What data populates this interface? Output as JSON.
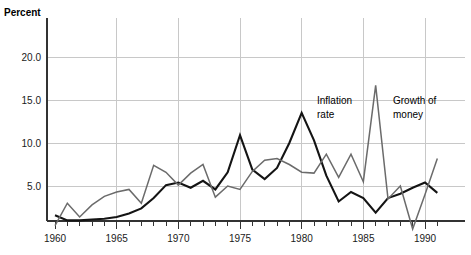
{
  "chart_data": {
    "type": "line",
    "title": "",
    "ylabel": "Percent",
    "xlabel": "",
    "grid": true,
    "legend_position": "inline-annotation",
    "xlim": [
      1959,
      1991.5
    ],
    "ylim": [
      -2.0,
      23.0
    ],
    "y_ticks": [
      5.0,
      10.0,
      15.0,
      20.0
    ],
    "y_tick_labels": [
      "5.0",
      "10.0",
      "15.0",
      "20.0"
    ],
    "x_ticks": [
      1960,
      1961,
      1962,
      1963,
      1964,
      1965,
      1966,
      1967,
      1968,
      1969,
      1970,
      1971,
      1972,
      1973,
      1974,
      1975,
      1976,
      1977,
      1978,
      1979,
      1980,
      1981,
      1982,
      1983,
      1984,
      1985,
      1986,
      1987,
      1988,
      1989,
      1990,
      1991
    ],
    "x_tick_labels": [
      "1960",
      "1965",
      "1970",
      "1975",
      "1980",
      "1985",
      "1990"
    ],
    "x_labeled_ticks": [
      1960,
      1965,
      1970,
      1975,
      1980,
      1985,
      1990
    ],
    "x": [
      1960,
      1961,
      1962,
      1963,
      1964,
      1965,
      1966,
      1967,
      1968,
      1969,
      1970,
      1971,
      1972,
      1973,
      1974,
      1975,
      1976,
      1977,
      1978,
      1979,
      1980,
      1981,
      1982,
      1983,
      1984,
      1985,
      1986,
      1987,
      1988,
      1989,
      1990,
      1991
    ],
    "series": [
      {
        "name": "Inflation rate",
        "color": "#141414",
        "width": 2.1,
        "values": [
          1.6,
          1.0,
          1.0,
          1.1,
          1.2,
          1.4,
          1.8,
          2.4,
          3.6,
          5.1,
          5.4,
          4.8,
          5.6,
          4.6,
          6.6,
          10.9,
          6.9,
          5.8,
          7.1,
          10.0,
          13.5,
          10.3,
          6.2,
          3.2,
          4.3,
          3.6,
          1.9,
          3.6,
          4.1,
          4.8,
          5.4,
          4.2
        ]
      },
      {
        "name": "Growth of money",
        "color": "#6b6b6b",
        "width": 1.5,
        "values": [
          0.4,
          3.0,
          1.4,
          2.8,
          3.8,
          4.3,
          4.6,
          3.0,
          7.4,
          6.6,
          5.1,
          6.5,
          7.5,
          3.7,
          5.0,
          4.6,
          6.7,
          8.0,
          8.2,
          7.5,
          6.6,
          6.5,
          8.7,
          6.0,
          8.7,
          5.5,
          16.7,
          3.5,
          5.0,
          0.0,
          4.0,
          8.2
        ]
      }
    ],
    "annotations": [
      {
        "text_line1": "Inflation",
        "text_line2": "rate",
        "x_px": 317,
        "y_px": 104,
        "series": "Inflation rate"
      },
      {
        "text_line1": "Growth of",
        "text_line2": "money",
        "x_px": 393,
        "y_px": 104,
        "series": "Growth of money"
      }
    ]
  },
  "axes": {
    "y_axis_title": "Percent"
  }
}
